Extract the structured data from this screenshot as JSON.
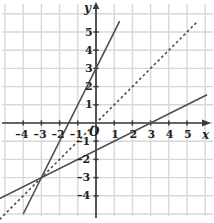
{
  "figure": {
    "title": "",
    "background_color": "#ffffff",
    "width": 214,
    "height": 223
  },
  "axes": {
    "x_name": "x",
    "y_name": "y",
    "origin_label": "O",
    "axis_color": "#3b3b3b",
    "grid_color": "#d8d8dc",
    "x_ticks": [
      {
        "value": -4,
        "label": "–4"
      },
      {
        "value": -3,
        "label": "–3"
      },
      {
        "value": -2,
        "label": "–2"
      },
      {
        "value": -1,
        "label": "–1"
      },
      {
        "value": 1,
        "label": "1"
      },
      {
        "value": 2,
        "label": "2"
      },
      {
        "value": 3,
        "label": "3"
      },
      {
        "value": 4,
        "label": "4"
      },
      {
        "value": 5,
        "label": "5"
      }
    ],
    "y_ticks": [
      {
        "value": 5,
        "label": "5"
      },
      {
        "value": 4,
        "label": "4"
      },
      {
        "value": 3,
        "label": "3"
      },
      {
        "value": 2,
        "label": "2"
      },
      {
        "value": 1,
        "label": "1"
      },
      {
        "value": -1,
        "label": "–1"
      },
      {
        "value": -2,
        "label": "–2"
      },
      {
        "value": -3,
        "label": "–3"
      },
      {
        "value": -4,
        "label": "–4"
      }
    ]
  },
  "chart_data": {
    "type": "line",
    "title": "",
    "xlabel": "x",
    "ylabel": "y",
    "xlim": [
      -5.3,
      6.1
    ],
    "ylim": [
      -5.1,
      5.6
    ],
    "grid": true,
    "legend": "none",
    "series": [
      {
        "name": "steep-solid-line",
        "style": "solid",
        "color": "#4d4d4d",
        "slope": 2,
        "intercept": 3,
        "equation": "y = 2x + 3",
        "points": [
          [
            -4.0,
            -5.0
          ],
          [
            1.3,
            5.6
          ]
        ]
      },
      {
        "name": "dashed-line",
        "style": "dashed",
        "color": "#4d4d4d",
        "slope": 1,
        "intercept": 0,
        "equation": "y = x",
        "points": [
          [
            -5.3,
            -5.3
          ],
          [
            5.6,
            5.6
          ]
        ]
      },
      {
        "name": "shallow-solid-line",
        "style": "solid",
        "color": "#4d4d4d",
        "slope": 0.5,
        "intercept": -1.5,
        "equation": "y = 0.5x − 1.5",
        "points": [
          [
            -5.3,
            -4.15
          ],
          [
            6.1,
            1.55
          ]
        ]
      }
    ],
    "intersection_points": [
      {
        "label": "",
        "x": -3,
        "y": -3
      }
    ],
    "annotations": []
  }
}
